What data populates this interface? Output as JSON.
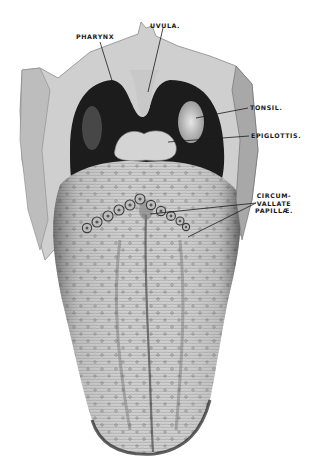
{
  "figure": {
    "labels": [
      {
        "id": "pharynx",
        "text": "PHARYNX",
        "x": 76,
        "y": 33
      },
      {
        "id": "uvula",
        "text": "UVULA.",
        "x": 150,
        "y": 22
      },
      {
        "id": "tonsil",
        "text": "TONSIL.",
        "x": 250,
        "y": 104
      },
      {
        "id": "epiglottis",
        "text": "EPIGLOTTIS.",
        "x": 251,
        "y": 132
      },
      {
        "id": "circumvallate",
        "lines": [
          "CIRCUM-",
          "VALLATE",
          "PAPILLÆ."
        ],
        "x": 255,
        "y": 192
      }
    ],
    "colors": {
      "background": "#ffffff",
      "tissue_light": "#d9d9d9",
      "tissue_mid": "#b3b3b3",
      "tissue_dark": "#5a5a5a",
      "cavity": "#1c1c1c",
      "ink": "#1a1a1a"
    }
  }
}
